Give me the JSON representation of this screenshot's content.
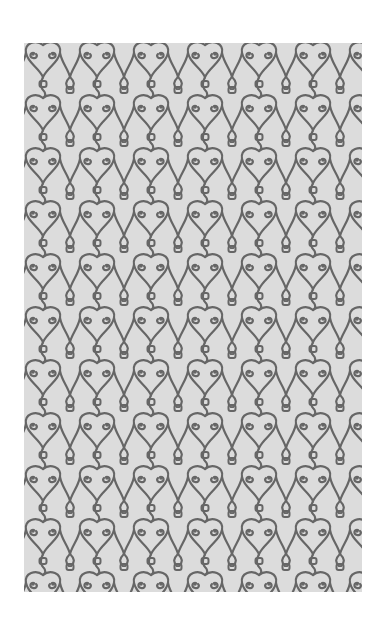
{
  "image": {
    "subject": "ornamental-scroll-pattern-swatch",
    "description": "Repeating wrought-iron style heart and scroll pattern on a light gray rectangle",
    "colors": {
      "page_background": "#ffffff",
      "swatch_background": "#dcdcdc",
      "motif_stroke": "#666666"
    },
    "tile": {
      "width": 54,
      "height": 53
    }
  }
}
